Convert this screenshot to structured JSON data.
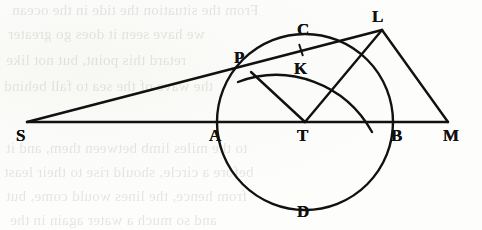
{
  "figure": {
    "ink_color": "#111111",
    "paper_color": "#fdfdfb",
    "width": 482,
    "height": 230,
    "points": [
      {
        "id": "S",
        "label": "S",
        "x": 27,
        "y": 122,
        "label_x": 16,
        "label_y": 127,
        "role": "left-vertex-on-baseline"
      },
      {
        "id": "A",
        "label": "A",
        "x": 218,
        "y": 122,
        "label_x": 209,
        "label_y": 127,
        "role": "circle-left-intersection"
      },
      {
        "id": "T",
        "label": "T",
        "x": 305,
        "y": 122,
        "label_x": 297,
        "label_y": 127,
        "role": "circle-center"
      },
      {
        "id": "B",
        "label": "B",
        "x": 393,
        "y": 122,
        "label_x": 391,
        "label_y": 127,
        "role": "circle-right-intersection"
      },
      {
        "id": "M",
        "label": "M",
        "x": 448,
        "y": 122,
        "label_x": 443,
        "label_y": 127,
        "role": "right-vertex-on-baseline"
      },
      {
        "id": "P",
        "label": "P",
        "x": 251,
        "y": 72,
        "label_x": 234,
        "label_y": 49,
        "role": "point-on-circle-upper-left"
      },
      {
        "id": "L",
        "label": "L",
        "x": 382,
        "y": 30,
        "label_x": 372,
        "label_y": 8,
        "role": "apex-vertex"
      },
      {
        "id": "C",
        "label": "C",
        "x": 305,
        "y": 34,
        "label_x": 297,
        "label_y": 21,
        "role": "circle-top"
      },
      {
        "id": "D",
        "label": "D",
        "x": 305,
        "y": 210,
        "label_x": 297,
        "label_y": 203,
        "role": "circle-bottom"
      },
      {
        "id": "K",
        "label": "K",
        "x": 301,
        "y": 50,
        "label_x": 294,
        "label_y": 60,
        "role": "tick-point-on-segment-PL"
      }
    ],
    "circle": {
      "cx": 305,
      "cy": 122,
      "r": 88,
      "stroke_width": 2.4
    },
    "arc_upper": {
      "description": "arc through C crossing segment PL and line TL",
      "start_x": 238,
      "start_y": 82,
      "end_x": 372,
      "end_y": 132,
      "rx": 110,
      "ry": 112
    },
    "segments": [
      {
        "id": "SM",
        "from": "S",
        "to": "M",
        "description": "baseline through A, T, B"
      },
      {
        "id": "SL",
        "from": "S",
        "to": "L",
        "description": "straight line through P and K"
      },
      {
        "id": "TP",
        "from": "T",
        "to": "P",
        "description": "radius to P"
      },
      {
        "id": "TL",
        "from": "T",
        "to": "L",
        "description": "line from center to apex"
      },
      {
        "id": "LM",
        "from": "L",
        "to": "M",
        "description": "line from apex down to M"
      }
    ],
    "tick_mark": {
      "x": 301,
      "y": 50,
      "angle_deg": 72,
      "length": 11
    }
  },
  "ghost_text": {
    "note": "faint mirrored show-through text from the reverse side of the page",
    "lines": [
      {
        "text": "From the situation the tide in the ocean",
        "x": 12,
        "y": 2,
        "size": 15
      },
      {
        "text": "we have seen it does go greater",
        "x": 8,
        "y": 26,
        "size": 15
      },
      {
        "text": "retard this point, but not like",
        "x": 6,
        "y": 52,
        "size": 15
      },
      {
        "text": "the wave of the sea to fall behind",
        "x": 4,
        "y": 78,
        "size": 15
      },
      {
        "text": "to the miles limb between them, and it",
        "x": 6,
        "y": 140,
        "size": 15
      },
      {
        "text": "before a circle, should rise to their least",
        "x": 4,
        "y": 164,
        "size": 15
      },
      {
        "text": "from hence, the lines would come, but",
        "x": 6,
        "y": 188,
        "size": 15
      },
      {
        "text": "and so much a water again in the",
        "x": 10,
        "y": 212,
        "size": 15
      }
    ]
  }
}
